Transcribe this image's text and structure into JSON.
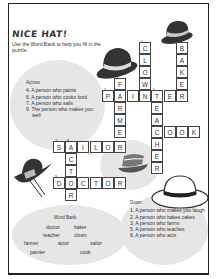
{
  "title": "NICE HAT!",
  "intro": "Use the Word Bank to help you fill in the puzzle.",
  "across": {
    "heading": "Across",
    "clues": [
      "4. A person who paints",
      "6. A person who cooks food",
      "7. A person who sails",
      "9. The person who makes you well"
    ]
  },
  "down": {
    "heading": "Down",
    "clues": [
      "1. A person who makes you laugh",
      "2. A person who bakes cakes",
      "3. A person who farms",
      "5. A person who teaches",
      "8. A person who acts"
    ]
  },
  "word_bank": {
    "title": "Word Bank",
    "words": [
      "doctor",
      "baker",
      "teacher",
      "clown",
      "farmer",
      "actor",
      "sailor",
      "painter",
      "cook"
    ]
  },
  "grid": {
    "cells": [
      {
        "x": 139,
        "y": 42,
        "l": "C",
        "n": "1"
      },
      {
        "x": 139,
        "y": 54,
        "l": "L"
      },
      {
        "x": 139,
        "y": 66,
        "l": "O"
      },
      {
        "x": 139,
        "y": 78,
        "l": "W"
      },
      {
        "x": 176,
        "y": 42,
        "l": "B",
        "n": "2"
      },
      {
        "x": 176,
        "y": 54,
        "l": "A"
      },
      {
        "x": 176,
        "y": 66,
        "l": "K"
      },
      {
        "x": 176,
        "y": 78,
        "l": "E"
      },
      {
        "x": 114,
        "y": 78,
        "l": "F",
        "n": "3"
      },
      {
        "x": 102,
        "y": 90,
        "l": "P",
        "n": "4"
      },
      {
        "x": 114,
        "y": 90,
        "l": "A"
      },
      {
        "x": 127,
        "y": 90,
        "l": "I"
      },
      {
        "x": 139,
        "y": 90,
        "l": "N"
      },
      {
        "x": 151,
        "y": 90,
        "l": "T",
        "n": "5"
      },
      {
        "x": 164,
        "y": 90,
        "l": "E"
      },
      {
        "x": 176,
        "y": 90,
        "l": "R"
      },
      {
        "x": 114,
        "y": 102,
        "l": "R"
      },
      {
        "x": 114,
        "y": 114,
        "l": "M"
      },
      {
        "x": 114,
        "y": 126,
        "l": "E"
      },
      {
        "x": 151,
        "y": 102,
        "l": "E"
      },
      {
        "x": 151,
        "y": 114,
        "l": "A"
      },
      {
        "x": 151,
        "y": 126,
        "l": "C",
        "n": "6"
      },
      {
        "x": 164,
        "y": 126,
        "l": "O"
      },
      {
        "x": 176,
        "y": 126,
        "l": "O"
      },
      {
        "x": 188,
        "y": 126,
        "l": "K"
      },
      {
        "x": 151,
        "y": 138,
        "l": "H"
      },
      {
        "x": 151,
        "y": 150,
        "l": "E"
      },
      {
        "x": 151,
        "y": 162,
        "l": "R"
      },
      {
        "x": 53,
        "y": 141,
        "l": "S",
        "n": "7"
      },
      {
        "x": 65,
        "y": 141,
        "l": "A",
        "n": "8"
      },
      {
        "x": 77,
        "y": 141,
        "l": "I"
      },
      {
        "x": 90,
        "y": 141,
        "l": "L"
      },
      {
        "x": 102,
        "y": 141,
        "l": "O"
      },
      {
        "x": 114,
        "y": 141,
        "l": "R"
      },
      {
        "x": 65,
        "y": 153,
        "l": "C"
      },
      {
        "x": 65,
        "y": 165,
        "l": "T"
      },
      {
        "x": 53,
        "y": 177,
        "l": "D",
        "n": "9"
      },
      {
        "x": 65,
        "y": 177,
        "l": "O"
      },
      {
        "x": 77,
        "y": 177,
        "l": "C"
      },
      {
        "x": 90,
        "y": 177,
        "l": "T"
      },
      {
        "x": 102,
        "y": 177,
        "l": "O"
      },
      {
        "x": 114,
        "y": 177,
        "l": "R"
      },
      {
        "x": 65,
        "y": 189,
        "l": "R"
      }
    ]
  }
}
